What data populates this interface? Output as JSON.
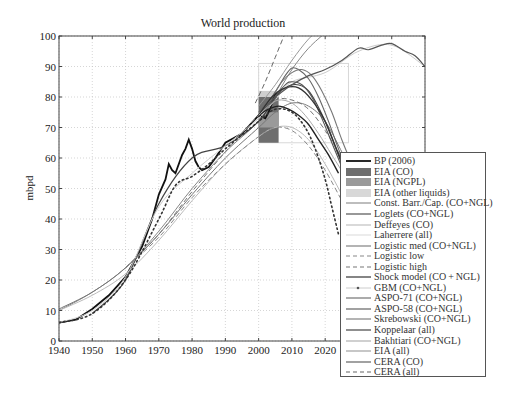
{
  "chart_data": {
    "type": "line",
    "title": "World production",
    "xlabel": "",
    "ylabel": "mbpd",
    "xlim": [
      1940,
      2050
    ],
    "ylim": [
      0,
      100
    ],
    "x_ticks": [
      1940,
      1950,
      1960,
      1970,
      1980,
      1990,
      2000,
      2010,
      2020
    ],
    "y_ticks": [
      0,
      10,
      20,
      30,
      40,
      50,
      60,
      70,
      80,
      90,
      100
    ],
    "grid": true,
    "legend_position": "lower right",
    "eia_bars": {
      "years": [
        2000,
        2006
      ],
      "segments": [
        {
          "name": "EIA (CO)",
          "from": 65,
          "to": 80,
          "color": "#6e6e6e"
        },
        {
          "name": "EIA (NGPL)",
          "from": 70,
          "to": 75,
          "color": "#9a9a9a"
        },
        {
          "name": "EIA (other liquids)",
          "from": 80,
          "to": 82,
          "color": "#cfcfcf"
        }
      ],
      "outline_box": {
        "x": [
          2000,
          2027
        ],
        "y": [
          65,
          91
        ]
      }
    },
    "series": [
      {
        "name": "BP (2006)",
        "style": "solid",
        "color": "#111",
        "width": 1.8,
        "x": [
          1940,
          1945,
          1950,
          1955,
          1960,
          1965,
          1968,
          1970,
          1972,
          1973,
          1974,
          1975,
          1977,
          1978,
          1979,
          1980,
          1981,
          1982,
          1983,
          1985,
          1987,
          1990,
          1995,
          2000,
          2002,
          2003,
          2004,
          2005,
          2006
        ],
        "y": [
          6,
          7,
          10.5,
          15,
          21,
          31,
          40,
          48,
          53,
          58,
          56,
          55,
          61,
          63,
          66,
          63,
          59,
          57,
          56,
          57,
          60,
          65,
          68,
          74,
          73,
          75,
          78,
          81,
          81
        ]
      },
      {
        "name": "EIA (CO)",
        "style": "bar",
        "color": "#6e6e6e"
      },
      {
        "name": "EIA (NGPL)",
        "style": "bar",
        "color": "#9a9a9a"
      },
      {
        "name": "EIA (other liquids)",
        "style": "bar",
        "color": "#cfcfcf"
      },
      {
        "name": "Const. Barr./Cap. (CO+NGL)",
        "style": "solid",
        "color": "#888",
        "width": 1,
        "x": [
          1940,
          1950,
          1960,
          1970,
          1980,
          1990,
          2000,
          2005,
          2010,
          2015,
          2020
        ],
        "y": [
          10,
          16,
          24,
          36,
          50,
          62,
          72,
          80,
          89,
          96,
          101
        ]
      },
      {
        "name": "Loglets (CO+NGL)",
        "style": "solid",
        "color": "#444",
        "width": 1.2,
        "x": [
          1950,
          1960,
          1970,
          1980,
          1990,
          2000,
          2005,
          2010,
          2015,
          2020,
          2025
        ],
        "y": [
          9,
          20,
          45,
          60,
          64,
          72,
          80,
          84,
          82,
          72,
          58
        ]
      },
      {
        "name": "Deffeyes (CO)",
        "style": "solid",
        "color": "#bbb",
        "width": 1,
        "x": [
          1940,
          1950,
          1960,
          1970,
          1980,
          1990,
          2000,
          2005,
          2010,
          2015,
          2020,
          2025
        ],
        "y": [
          10,
          15,
          22,
          33,
          46,
          58,
          67,
          70,
          70,
          66,
          58,
          48
        ]
      },
      {
        "name": "Laherrere (all)",
        "style": "solid",
        "color": "#ccc",
        "width": 1,
        "x": [
          1940,
          1950,
          1960,
          1970,
          1980,
          1990,
          2000,
          2005,
          2010,
          2020,
          2030,
          2040,
          2050
        ],
        "y": [
          6,
          10,
          21,
          44,
          55,
          64,
          73,
          79,
          85,
          88,
          95,
          97,
          90
        ]
      },
      {
        "name": "Logistic med (CO+NGL)",
        "style": "solid",
        "color": "#777",
        "width": 1,
        "x": [
          1940,
          1950,
          1960,
          1970,
          1980,
          1990,
          2000,
          2005,
          2010,
          2015,
          2020,
          2025
        ],
        "y": [
          10.5,
          16,
          24,
          35,
          48,
          60,
          70,
          75,
          78,
          77,
          72,
          62
        ]
      },
      {
        "name": "Logistic low",
        "style": "dashed",
        "color": "#888",
        "width": 1,
        "x": [
          1960,
          1970,
          1980,
          1990,
          2000,
          2005,
          2010,
          2015,
          2020,
          2025
        ],
        "y": [
          24,
          34,
          47,
          58,
          67,
          70,
          69,
          64,
          56,
          46
        ]
      },
      {
        "name": "Logistic high",
        "style": "dashed",
        "color": "#777",
        "width": 1,
        "x": [
          1960,
          1970,
          1980,
          1990,
          2000,
          2005,
          2010,
          2015,
          2020,
          2025,
          2028
        ],
        "y": [
          24,
          35,
          49,
          62,
          74,
          79,
          79,
          76,
          69,
          60,
          54
        ]
      },
      {
        "name": "Shock model (CO+NGL)",
        "style": "solid",
        "color": "#222",
        "width": 1.4,
        "x": [
          2000,
          2003,
          2006,
          2009,
          2012,
          2015,
          2018,
          2021,
          2024
        ],
        "y": [
          74,
          76,
          77,
          76,
          74,
          71,
          66,
          61,
          55
        ]
      },
      {
        "name": "GBM (CO+NGL)",
        "style": "dotted",
        "color": "#333",
        "width": 1.6,
        "x": [
          1940,
          1950,
          1960,
          1970,
          1975,
          1980,
          1985,
          1990,
          2000,
          2005,
          2010,
          2014,
          2017,
          2020,
          2022,
          2024
        ],
        "y": [
          6,
          9,
          20,
          40,
          51,
          54,
          58,
          63,
          72,
          76,
          75,
          70,
          63,
          53,
          44,
          35
        ]
      },
      {
        "name": "ASPO-71 (CO+NGL)",
        "style": "solid",
        "color": "#666",
        "width": 1.1,
        "x": [
          2000,
          2004,
          2008,
          2010,
          2012,
          2015,
          2018,
          2021,
          2024,
          2027
        ],
        "y": [
          75,
          80,
          87,
          89.5,
          89,
          86,
          80,
          72,
          63,
          55
        ]
      },
      {
        "name": "ASPO-58 (CO+NGL)",
        "style": "solid",
        "color": "#555",
        "width": 1.1,
        "x": [
          2000,
          2004,
          2008,
          2010,
          2013,
          2016,
          2019,
          2022,
          2025
        ],
        "y": [
          74,
          79,
          84,
          85,
          84,
          80,
          73,
          65,
          57
        ]
      },
      {
        "name": "Skrebowski (CO+NGL)",
        "style": "solid",
        "color": "#777",
        "width": 1.1,
        "x": [
          2000,
          2004,
          2007,
          2010,
          2013,
          2016,
          2019,
          2022,
          2025,
          2028
        ],
        "y": [
          74,
          80,
          85,
          88,
          89,
          87,
          82,
          75,
          66,
          58
        ]
      },
      {
        "name": "Koppelaar (all)",
        "style": "solid",
        "color": "#333",
        "width": 1.3,
        "x": [
          2000,
          2004,
          2008,
          2012,
          2016,
          2020,
          2023,
          2026
        ],
        "y": [
          74,
          80,
          83,
          83,
          79,
          72,
          64,
          56
        ]
      },
      {
        "name": "Bakhtiari (CO+NGL)",
        "style": "solid",
        "color": "#aaa",
        "width": 1,
        "x": [
          2000,
          2003,
          2006,
          2010,
          2014,
          2018,
          2022,
          2026
        ],
        "y": [
          74,
          77,
          79,
          78,
          74,
          68,
          61,
          54
        ]
      },
      {
        "name": "EIA (all)",
        "style": "solid",
        "color": "#999",
        "width": 1,
        "x": [
          2000,
          2005,
          2010,
          2015,
          2020,
          2025,
          2030
        ],
        "y": [
          77,
          84,
          92,
          99,
          104,
          110,
          115
        ]
      },
      {
        "name": "CERA (CO)",
        "style": "solid",
        "color": "#555",
        "width": 1.2,
        "x": [
          2005,
          2010,
          2015,
          2020,
          2025,
          2030,
          2033,
          2037,
          2040,
          2044,
          2047,
          2050
        ],
        "y": [
          80,
          84,
          87,
          89,
          92,
          96,
          95.5,
          97,
          97.5,
          95,
          93.5,
          90
        ]
      },
      {
        "name": "CERA (all)",
        "style": "dashed",
        "color": "#666",
        "width": 1,
        "x": [
          1999,
          2002,
          2005,
          2008,
          2011
        ],
        "y": [
          78,
          85,
          93,
          101,
          108
        ]
      }
    ]
  },
  "legend": {
    "items": [
      {
        "label": "BP (2006)",
        "swatch": "line-dot",
        "color": "#111"
      },
      {
        "label": "EIA (CO)",
        "swatch": "box",
        "color": "#6e6e6e"
      },
      {
        "label": "EIA (NGPL)",
        "swatch": "box",
        "color": "#9a9a9a"
      },
      {
        "label": "EIA (other liquids)",
        "swatch": "box",
        "color": "#d8d8d8"
      },
      {
        "label": "Const. Barr./Cap. (CO+NGL)",
        "swatch": "solid",
        "color": "#888"
      },
      {
        "label": "Loglets (CO+NGL)",
        "swatch": "solid",
        "color": "#444"
      },
      {
        "label": "Deffeyes (CO)",
        "swatch": "solid",
        "color": "#bbb"
      },
      {
        "label": "Laherrere (all)",
        "swatch": "solid",
        "color": "#ddd"
      },
      {
        "label": "Logistic med (CO+NGL)",
        "swatch": "solid",
        "color": "#777"
      },
      {
        "label": "Logistic low",
        "swatch": "dashed",
        "color": "#888"
      },
      {
        "label": "Logistic high",
        "swatch": "dashed",
        "color": "#777"
      },
      {
        "label": "Shock model (CO + NGL)",
        "swatch": "solid",
        "color": "#222"
      },
      {
        "label": "GBM (CO+NGL)",
        "swatch": "dot",
        "color": "#555"
      },
      {
        "label": "ASPO-71 (CO+NGL)",
        "swatch": "solid",
        "color": "#666"
      },
      {
        "label": "ASPO-58 (CO+NGL)",
        "swatch": "solid",
        "color": "#555"
      },
      {
        "label": "Skrebowski (CO+NGL)",
        "swatch": "solid",
        "color": "#777"
      },
      {
        "label": "Koppelaar (all)",
        "swatch": "solid",
        "color": "#333"
      },
      {
        "label": "Bakhtiari (CO+NGL)",
        "swatch": "solid",
        "color": "#aaa"
      },
      {
        "label": "EIA (all)",
        "swatch": "solid",
        "color": "#999"
      },
      {
        "label": "CERA (CO)",
        "swatch": "solid",
        "color": "#555"
      },
      {
        "label": "CERA (all)",
        "swatch": "dashed",
        "color": "#666"
      }
    ]
  }
}
